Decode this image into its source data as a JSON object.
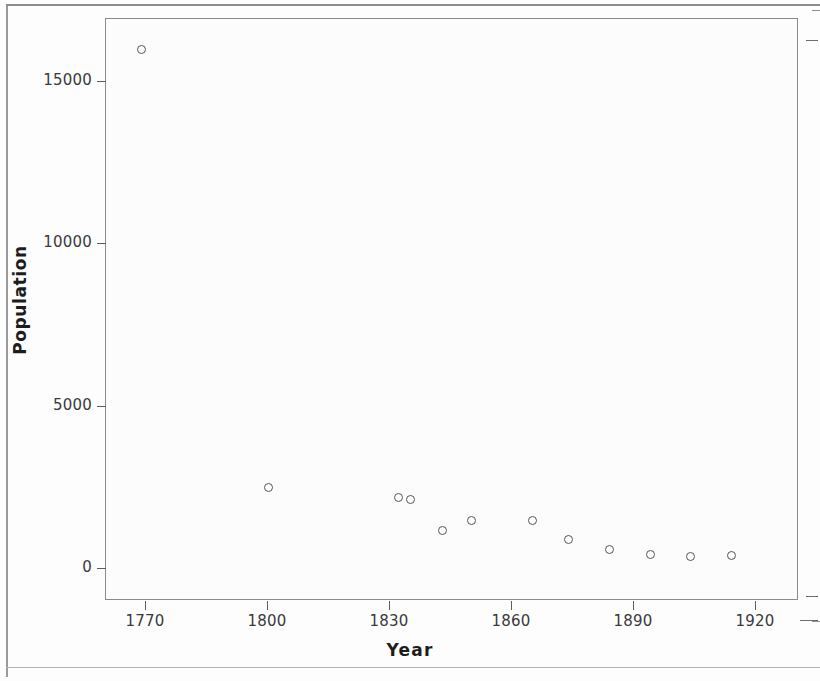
{
  "chart_data": {
    "type": "scatter",
    "title": "",
    "xlabel": "Year",
    "ylabel": "Population",
    "xlim": [
      1762,
      1932
    ],
    "ylim": [
      -600,
      16600
    ],
    "grid": false,
    "legend": null,
    "marker_style": "open-circle",
    "marker_color": "#55555a",
    "xticks": [
      1770,
      1800,
      1830,
      1860,
      1890,
      1920
    ],
    "xtick_labels": [
      "1770",
      "1800",
      "1830",
      "1860",
      "1890",
      "1920"
    ],
    "yticks": [
      0,
      5000,
      10000,
      15000
    ],
    "ytick_labels": [
      "0",
      "5000",
      "10000",
      "15000"
    ],
    "x": [
      1769,
      1800,
      1832,
      1835,
      1843,
      1850,
      1865,
      1874,
      1884,
      1894,
      1904,
      1914
    ],
    "y": [
      16000,
      2500,
      2200,
      2150,
      1200,
      1500,
      1500,
      900,
      600,
      450,
      400,
      420
    ],
    "points": [
      {
        "year": 1769,
        "population": 16000
      },
      {
        "year": 1800,
        "population": 2500
      },
      {
        "year": 1832,
        "population": 2200
      },
      {
        "year": 1835,
        "population": 2150
      },
      {
        "year": 1843,
        "population": 1200
      },
      {
        "year": 1850,
        "population": 1500
      },
      {
        "year": 1865,
        "population": 1500
      },
      {
        "year": 1874,
        "population": 900
      },
      {
        "year": 1884,
        "population": 600
      },
      {
        "year": 1894,
        "population": 450
      },
      {
        "year": 1904,
        "population": 400
      },
      {
        "year": 1914,
        "population": 420
      }
    ]
  },
  "axes": {
    "x_title": "Year",
    "y_title": "Population"
  }
}
